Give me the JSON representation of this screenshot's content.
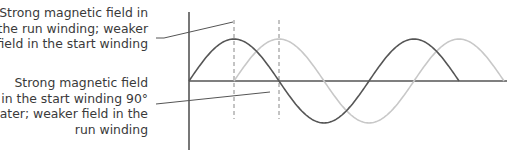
{
  "diagram": {
    "annotations": [
      {
        "id": "run",
        "lines": [
          "Strong magnetic field in",
          "the run winding; weaker",
          "field in the start winding"
        ]
      },
      {
        "id": "start",
        "lines": [
          "Strong magnetic field",
          "in the start winding 90°",
          "later; weaker field in the",
          "run winding"
        ]
      }
    ],
    "series": [
      {
        "name": "run-winding-field",
        "color": "#555555",
        "phase_deg": 0,
        "cycles": 1.5
      },
      {
        "name": "start-winding-field",
        "color": "#c8c8c8",
        "phase_deg": 90,
        "cycles": 1.5
      }
    ],
    "markers_deg": [
      90,
      180
    ],
    "colors": {
      "axis": "#555555",
      "text": "#3a3a3a",
      "leader": "#555555",
      "dashed": "#888888"
    }
  }
}
